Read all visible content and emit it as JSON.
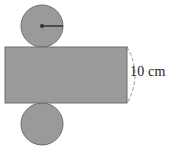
{
  "figure": {
    "canvas": {
      "width": 172,
      "height": 150,
      "background": "#ffffff"
    },
    "colors": {
      "shape_fill": "#9a9a9a",
      "shape_stroke": "#6e6e6e",
      "radius_line": "#3a3a3a",
      "center_dot": "#2b2b2b",
      "dashed_arc": "#b0b0b0",
      "label_text": "#1a1a1a"
    },
    "shapes": {
      "top_circle": {
        "name": "top-base-circle",
        "cx": 42,
        "cy": 26,
        "r": 21,
        "has_center_dot": true,
        "has_radius_line": true,
        "radius_line_from": [
          42,
          26
        ],
        "radius_line_to": [
          63,
          26
        ]
      },
      "bottom_circle": {
        "name": "bottom-base-circle",
        "cx": 42,
        "cy": 124,
        "r": 21,
        "has_center_dot": false,
        "has_radius_line": false
      },
      "rectangle": {
        "name": "lateral-surface-rectangle",
        "x": 5,
        "y": 47,
        "width": 122,
        "height": 56
      },
      "dashed_arc": {
        "name": "cylinder-edge-dashed-arc",
        "start": [
          127,
          47
        ],
        "end": [
          127,
          103
        ],
        "bulge_x": 143,
        "dash_pattern": "3 3"
      }
    },
    "labels": {
      "dimension": {
        "text": "10 cm",
        "value": 10,
        "unit": "cm",
        "x": 130,
        "y": 64
      }
    }
  }
}
